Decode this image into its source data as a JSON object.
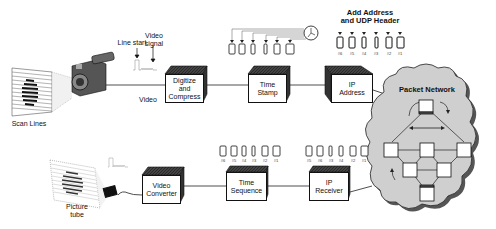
{
  "diagram": {
    "transmit_path": {
      "scan_lines_label": "Scan Lines",
      "line_start_label": "Line start",
      "video_signal_label": "Video\nsignal",
      "video_line_label": "Video",
      "digitize_box": "Digitize\nand\nCompress",
      "time_stamp_box": "Time\nStamp",
      "ip_address_box": "IP\nAddress",
      "add_address_label": "Add Address\nand UDP Header",
      "header_packets": [
        "#6",
        "#5",
        "#4",
        "#3",
        "#2",
        "#1"
      ]
    },
    "network": {
      "label": "Packet Network"
    },
    "receive_path": {
      "ip_receiver_box": "IP\nReceiver",
      "receiver_packets": [
        "#5",
        "#6",
        "#3",
        "#4",
        "#2",
        "#1"
      ],
      "time_sequence_box": "Time\nSequence",
      "sequenced_packets": [
        "#6",
        "#5",
        "#4",
        "#3",
        "#2",
        "#1"
      ],
      "video_converter_box": "Video\nConverter",
      "picture_tube_label": "Picture\ntube"
    }
  }
}
